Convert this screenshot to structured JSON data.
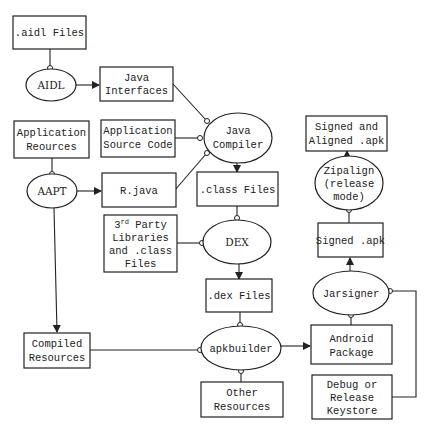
{
  "diagram": {
    "nodes": {
      "aidl_files": {
        "lines": [
          ".aidl Files"
        ],
        "shape": "box"
      },
      "aidl": {
        "lines": [
          "AIDL"
        ],
        "shape": "ellipse"
      },
      "java_interfaces": {
        "lines": [
          "Java",
          "Interfaces"
        ],
        "shape": "box"
      },
      "app_resources": {
        "lines": [
          "Application",
          "Reources"
        ],
        "shape": "box"
      },
      "app_source": {
        "lines": [
          "Application",
          "Source Code"
        ],
        "shape": "box"
      },
      "java_compiler": {
        "lines": [
          "Java",
          "Compiler"
        ],
        "shape": "ellipse"
      },
      "aapt": {
        "lines": [
          "AAPT"
        ],
        "shape": "ellipse"
      },
      "r_java": {
        "lines": [
          "R.java"
        ],
        "shape": "box"
      },
      "class_files": {
        "lines": [
          ".class Files"
        ],
        "shape": "box"
      },
      "third_party": {
        "lines": [
          "3rd Party",
          "Libraries",
          "and .class",
          "Files"
        ],
        "sup": "rd",
        "shape": "box"
      },
      "dex": {
        "lines": [
          "DEX"
        ],
        "shape": "ellipse"
      },
      "dex_files": {
        "lines": [
          ".dex Files"
        ],
        "shape": "box"
      },
      "compiled_resources": {
        "lines": [
          "Compiled",
          "Resources"
        ],
        "shape": "box"
      },
      "apkbuilder": {
        "lines": [
          "apkbuilder"
        ],
        "shape": "ellipse"
      },
      "other_resources": {
        "lines": [
          "Other",
          "Resources"
        ],
        "shape": "box"
      },
      "android_package": {
        "lines": [
          "Android",
          "Package"
        ],
        "shape": "box"
      },
      "keystore": {
        "lines": [
          "Debug or",
          "Release",
          "Keystore"
        ],
        "shape": "box"
      },
      "jarsigner": {
        "lines": [
          "Jarsigner"
        ],
        "shape": "ellipse"
      },
      "signed_apk": {
        "lines": [
          "Signed .apk"
        ],
        "shape": "box"
      },
      "zipalign": {
        "lines": [
          "Zipalign",
          "(release",
          "mode)"
        ],
        "shape": "ellipse"
      },
      "signed_aligned_apk": {
        "lines": [
          "Signed and",
          "Aligned .apk"
        ],
        "shape": "box"
      }
    },
    "edges": [
      {
        "from": "aidl_files",
        "to": "aidl",
        "style": "input"
      },
      {
        "from": "aidl",
        "to": "java_interfaces",
        "style": "output"
      },
      {
        "from": "java_interfaces",
        "to": "java_compiler",
        "style": "input"
      },
      {
        "from": "app_source",
        "to": "java_compiler",
        "style": "input"
      },
      {
        "from": "r_java",
        "to": "java_compiler",
        "style": "input"
      },
      {
        "from": "app_resources",
        "to": "aapt",
        "style": "input"
      },
      {
        "from": "aapt",
        "to": "r_java",
        "style": "output"
      },
      {
        "from": "aapt",
        "to": "compiled_resources",
        "style": "output"
      },
      {
        "from": "java_compiler",
        "to": "class_files",
        "style": "output"
      },
      {
        "from": "class_files",
        "to": "dex",
        "style": "input"
      },
      {
        "from": "third_party",
        "to": "dex",
        "style": "input"
      },
      {
        "from": "dex",
        "to": "dex_files",
        "style": "output"
      },
      {
        "from": "dex_files",
        "to": "apkbuilder",
        "style": "input"
      },
      {
        "from": "compiled_resources",
        "to": "apkbuilder",
        "style": "input"
      },
      {
        "from": "other_resources",
        "to": "apkbuilder",
        "style": "input"
      },
      {
        "from": "apkbuilder",
        "to": "android_package",
        "style": "output"
      },
      {
        "from": "android_package",
        "to": "jarsigner",
        "style": "input"
      },
      {
        "from": "keystore",
        "to": "jarsigner",
        "style": "input"
      },
      {
        "from": "jarsigner",
        "to": "signed_apk",
        "style": "output"
      },
      {
        "from": "signed_apk",
        "to": "zipalign",
        "style": "input"
      },
      {
        "from": "zipalign",
        "to": "signed_aligned_apk",
        "style": "output"
      }
    ]
  }
}
